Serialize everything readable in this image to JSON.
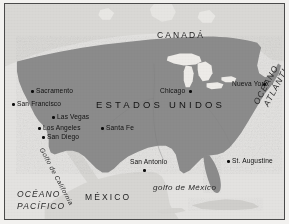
{
  "map": {
    "title": "Mapa de Estados Unidos",
    "colors": {
      "page_background": "#f2f1ef",
      "frame_border": "#4a4a4a",
      "ocean": "#e3e2e0",
      "united_states_land": "#8b8b8b",
      "neighbor_land": "#d2d1cf",
      "lakes": "#eceae7",
      "city_dot": "#0d0d0d",
      "label_text": "#141414"
    },
    "countries": [
      {
        "name": "CANADÁ",
        "x": 152,
        "y": 27,
        "style": "country"
      },
      {
        "name": "ESTADOS UNIDOS",
        "x": 91,
        "y": 96,
        "style": "country-main"
      },
      {
        "name": "MÉXICO",
        "x": 80,
        "y": 189,
        "style": "country"
      }
    ],
    "oceans": [
      {
        "name": "OCÉANO",
        "x": 12,
        "y": 186,
        "style": "ocean"
      },
      {
        "name": "PACÍFICO",
        "x": 12,
        "y": 198,
        "style": "ocean"
      },
      {
        "name": "OCÉANO",
        "x": 247,
        "y": 98,
        "style": "ocean-rotated"
      },
      {
        "name": "ATLÁNTICO",
        "x": 256,
        "y": 98,
        "style": "ocean-rotated"
      }
    ],
    "water_features": [
      {
        "name": "golfo de México",
        "x": 148,
        "y": 180,
        "style": "water-italic"
      },
      {
        "name": "Golfo de California",
        "x": 39,
        "y": 148,
        "style": "water-rotated"
      }
    ],
    "cities": [
      {
        "name": "Sacramento",
        "label_x": 30,
        "label_y": 85,
        "dot_x": 26,
        "dot_y": 86,
        "dot_side": "left"
      },
      {
        "name": "San Francisco",
        "label_x": 11,
        "label_y": 98,
        "dot_x": 7,
        "dot_y": 99,
        "dot_side": "left"
      },
      {
        "name": "Las Vegas",
        "label_x": 51,
        "label_y": 111,
        "dot_x": 47,
        "dot_y": 112,
        "dot_side": "left"
      },
      {
        "name": "Los Angeles",
        "label_x": 37,
        "label_y": 122,
        "dot_x": 33,
        "dot_y": 123,
        "dot_side": "left"
      },
      {
        "name": "San Diego",
        "label_x": 41,
        "label_y": 131,
        "dot_x": 37,
        "dot_y": 132,
        "dot_side": "left"
      },
      {
        "name": "Santa Fe",
        "label_x": 101,
        "label_y": 122,
        "dot_x": 96,
        "dot_y": 123,
        "dot_side": "left"
      },
      {
        "name": "San Antonio",
        "label_x": 125,
        "label_y": 156,
        "dot_x": 138,
        "dot_y": 165,
        "dot_side": "below"
      },
      {
        "name": "Chicago",
        "label_x": 155,
        "label_y": 85,
        "dot_x": 185,
        "dot_y": 86,
        "dot_side": "right"
      },
      {
        "name": "Nueva York",
        "label_x": 228,
        "label_y": 78,
        "dot_x": 258,
        "dot_y": 79,
        "dot_side": "right"
      },
      {
        "name": "St. Augustine",
        "label_x": 228,
        "label_y": 155,
        "dot_x": 223,
        "dot_y": 156,
        "dot_side": "left"
      }
    ]
  }
}
